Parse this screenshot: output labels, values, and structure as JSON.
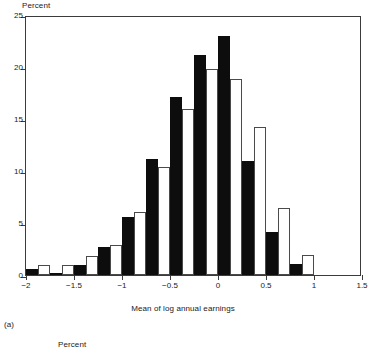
{
  "figure": {
    "panel_letter": "(a)",
    "y_axis_title": "Percent",
    "x_axis_title": "Mean of log annual earnings",
    "next_panel_y_axis_title": "Percent"
  },
  "chart_data": {
    "type": "bar",
    "title": "",
    "subtitle": "",
    "xlabel": "Mean of log annual earnings",
    "ylabel": "Percent",
    "xlim": [
      -2,
      1.5
    ],
    "ylim": [
      0,
      25
    ],
    "xticks": [
      -2,
      -1.5,
      -1,
      -0.5,
      0,
      0.5,
      1,
      1.5
    ],
    "xtick_labels": [
      "−2",
      "−1.5",
      "−1",
      "−0.5",
      "0",
      "0.5",
      "1",
      "1.5"
    ],
    "yticks": [
      0,
      5,
      10,
      15,
      20,
      25
    ],
    "ytick_labels": [
      "0",
      "5",
      "10",
      "15",
      "20",
      "25"
    ],
    "grid": false,
    "legend": "none",
    "bin_width": 0.25,
    "bin_centers": [
      -1.875,
      -1.625,
      -1.375,
      -1.125,
      -0.875,
      -0.625,
      -0.375,
      -0.125,
      0.125,
      0.375,
      0.625,
      0.875
    ],
    "categories": [
      "-1.875",
      "-1.625",
      "-1.375",
      "-1.125",
      "-0.875",
      "-0.625",
      "-0.375",
      "-0.125",
      "0.125",
      "0.375",
      "0.625",
      "0.875"
    ],
    "series": [
      {
        "name": "filled",
        "fill": "#0d0d0d",
        "values": [
          0.6,
          0.2,
          1.0,
          2.7,
          5.6,
          11.2,
          17.1,
          21.2,
          23.0,
          11.0,
          4.1,
          1.1
        ]
      },
      {
        "name": "open",
        "fill": "#ffffff",
        "values": [
          1.0,
          1.0,
          1.8,
          2.9,
          6.1,
          10.4,
          16.0,
          19.8,
          18.8,
          14.2,
          6.4,
          1.9
        ]
      }
    ]
  },
  "colors": {
    "filled_bar": "#0d0d0d",
    "open_bar_stroke": "#4a4a4a",
    "axis": "#3b3b3b",
    "background": "#ffffff"
  }
}
